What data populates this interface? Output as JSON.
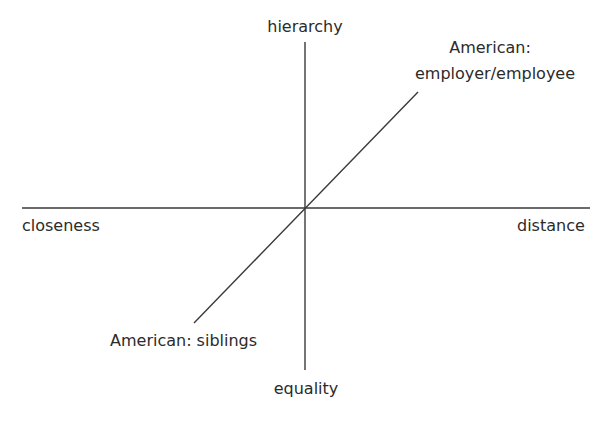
{
  "diagram": {
    "type": "quadrant-axes",
    "axes": {
      "vertical": {
        "top_label": "hierarchy",
        "bottom_label": "equality"
      },
      "horizontal": {
        "left_label": "closeness",
        "right_label": "distance"
      }
    },
    "diagonal": {
      "upper_end_label_line1": "American:",
      "upper_end_label_line2": "employer/employee",
      "lower_end_label": "American: siblings"
    },
    "colors": {
      "line": "#3a3a3a",
      "text": "#2b2b2b",
      "background": "#ffffff"
    }
  }
}
